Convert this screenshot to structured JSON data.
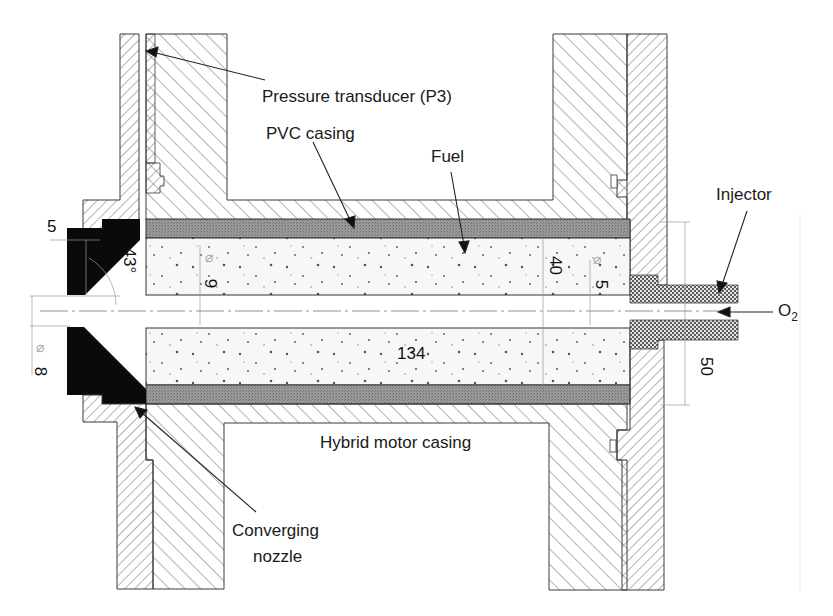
{
  "figure": {
    "type": "cross-section engineering drawing"
  },
  "labels": {
    "pressure_transducer": "Pressure transducer (P3)",
    "pvc_casing": "PVC casing",
    "fuel": "Fuel",
    "injector": "Injector",
    "oxidizer": "O",
    "oxidizer_sub": "2",
    "hybrid_motor_casing": "Hybrid motor casing",
    "converging_nozzle_line1": "Converging",
    "converging_nozzle_line2": "nozzle"
  },
  "dimensions": {
    "nozzle_step": "5",
    "nozzle_angle": "43°",
    "port_diameter": "9",
    "throat_diameter": "8",
    "grain_outer": "40",
    "injector_bore": "5",
    "grain_length": "134",
    "casing_outer": "50",
    "diameter_symbol": "⌀"
  },
  "colors": {
    "line": "#3a3a3a",
    "hatch": "#5a5a5a",
    "pvc_fill": "#8c8c8c",
    "nozzle_fill": "#0a0a0a",
    "fuel_fill": "#f6f6f6",
    "injector_fill": "#9a9a9a",
    "dim_line": "#9a9a9a"
  }
}
